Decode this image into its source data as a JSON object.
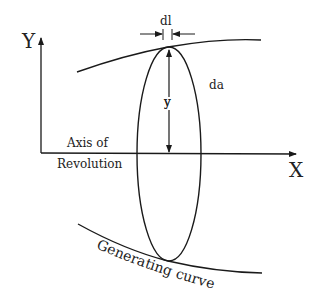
{
  "diagram": {
    "axis_y_label": "Y",
    "axis_x_label": "X",
    "dl_label": "dl",
    "da_label": "da",
    "y_label": "y",
    "axis_label_line1": "Axis of",
    "axis_label_line2": "Revolution",
    "curve_label": "Generating curve",
    "stroke_color": "#1a1a1a"
  }
}
